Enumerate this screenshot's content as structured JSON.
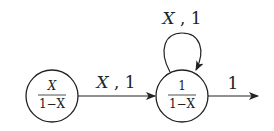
{
  "diagram": {
    "type": "weighted-automaton",
    "colors": {
      "stroke": "#222222",
      "background": "#ffffff"
    },
    "states": [
      {
        "id": "s1",
        "numerator": "X",
        "denominator": "1−X",
        "numerator_italic": true
      },
      {
        "id": "s2",
        "numerator": "1",
        "denominator": "1−X",
        "numerator_italic": false
      }
    ],
    "edges": [
      {
        "from": "s1",
        "to": "s2",
        "label_symbol": "X",
        "label_sep": " ,",
        "label_weight": " 1"
      },
      {
        "from": "s2",
        "to": "s2",
        "label_symbol": "X",
        "label_sep": " ,",
        "label_weight": " 1",
        "self_loop": true
      },
      {
        "from": "s2",
        "to": "exit",
        "label_weight": "1"
      }
    ]
  }
}
